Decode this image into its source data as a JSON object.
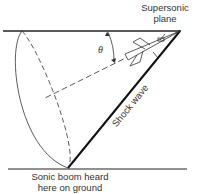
{
  "diagram": {
    "labels": {
      "plane_line1": "Supersonic",
      "plane_line2": "plane",
      "angle": "θ",
      "shock": "Shock wave",
      "ground_line1": "Sonic boom heard",
      "ground_line2": "here on ground"
    },
    "colors": {
      "line": "#222222",
      "text": "#333333"
    }
  }
}
